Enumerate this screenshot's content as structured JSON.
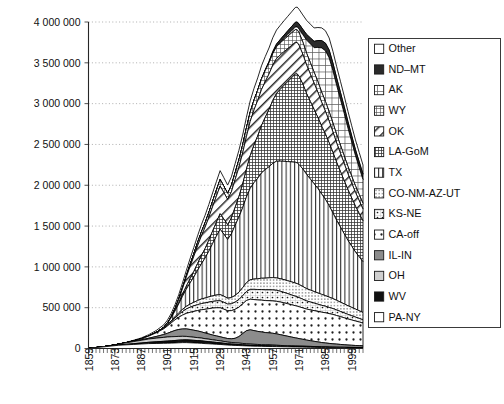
{
  "chart_data": {
    "type": "area",
    "stacked": true,
    "title": "",
    "subtitle": "",
    "xlabel": "",
    "ylabel": "",
    "grid": true,
    "legend_position": "right",
    "xlim": [
      1859,
      2005
    ],
    "ylim": [
      0,
      4000000
    ],
    "y_ticks": [
      0,
      500000,
      1000000,
      1500000,
      2000000,
      2500000,
      3000000,
      3500000,
      4000000
    ],
    "y_tick_labels": [
      "0",
      "500 000",
      "1 000 000",
      "1 500 000",
      "2 000 000",
      "2 500 000",
      "3 000 000",
      "3 500 000",
      "4 000 000"
    ],
    "x_ticks": [
      1859,
      1873,
      1887,
      1901,
      1915,
      1929,
      1943,
      1957,
      1971,
      1985,
      1999
    ],
    "x_tick_labels": [
      "1859",
      "1873",
      "1887",
      "1901",
      "1915",
      "1929",
      "1943",
      "1957",
      "1971",
      "1985",
      "1999"
    ],
    "x_minor_tick_interval": 2,
    "x": [
      1859,
      1863,
      1867,
      1871,
      1875,
      1879,
      1883,
      1887,
      1891,
      1895,
      1899,
      1901,
      1903,
      1905,
      1907,
      1909,
      1911,
      1913,
      1915,
      1917,
      1919,
      1921,
      1923,
      1925,
      1927,
      1929,
      1931,
      1933,
      1935,
      1937,
      1939,
      1941,
      1943,
      1945,
      1947,
      1949,
      1951,
      1953,
      1955,
      1957,
      1959,
      1961,
      1963,
      1965,
      1967,
      1969,
      1970,
      1971,
      1973,
      1975,
      1977,
      1979,
      1981,
      1983,
      1985,
      1987,
      1989,
      1991,
      1993,
      1995,
      1997,
      1999,
      2001,
      2003,
      2005
    ],
    "series": [
      {
        "name": "PA-NY",
        "pattern": "solid-white",
        "values": [
          2000,
          12000,
          20000,
          30000,
          40000,
          45000,
          50000,
          55000,
          60000,
          62000,
          64000,
          65000,
          66000,
          68000,
          70000,
          72000,
          72000,
          70000,
          68000,
          66000,
          64000,
          60000,
          58000,
          55000,
          52000,
          50000,
          46000,
          42000,
          40000,
          38000,
          36000,
          34000,
          32000,
          30000,
          29000,
          28000,
          27000,
          26000,
          25000,
          24000,
          23000,
          22000,
          21000,
          20000,
          19000,
          18000,
          18000,
          17500,
          17000,
          16000,
          15000,
          14000,
          13000,
          12000,
          11000,
          10000,
          9500,
          9000,
          8500,
          8000,
          7500,
          7000,
          6800,
          6500,
          6000
        ]
      },
      {
        "name": "WV",
        "pattern": "solid-black",
        "values": [
          0,
          0,
          0,
          1000,
          3000,
          6000,
          9000,
          12000,
          16000,
          20000,
          24000,
          26000,
          28000,
          30000,
          32000,
          33000,
          34000,
          33000,
          32000,
          31000,
          30000,
          28000,
          26000,
          24000,
          22000,
          20000,
          18000,
          16000,
          15000,
          14000,
          13000,
          12000,
          11000,
          10000,
          9500,
          9000,
          8500,
          8000,
          7500,
          7000,
          6500,
          6000,
          5500,
          5200,
          5000,
          4800,
          4700,
          4600,
          4400,
          4200,
          4000,
          3800,
          3600,
          3400,
          3200,
          3000,
          2900,
          2800,
          2700,
          2600,
          2500,
          2400,
          2300,
          2200,
          2100
        ]
      },
      {
        "name": "OH",
        "pattern": "light-gray",
        "values": [
          0,
          0,
          2000,
          5000,
          10000,
          18000,
          26000,
          33000,
          40000,
          45000,
          48000,
          50000,
          50000,
          48000,
          46000,
          44000,
          42000,
          40000,
          38000,
          36000,
          34000,
          32000,
          30000,
          28000,
          26000,
          24000,
          22000,
          20000,
          19000,
          18000,
          17000,
          16000,
          15000,
          14000,
          13000,
          12500,
          12000,
          11500,
          11000,
          10500,
          10000,
          9500,
          9000,
          8500,
          8000,
          7500,
          7400,
          7200,
          7000,
          6800,
          6500,
          6200,
          6000,
          5800,
          5500,
          5200,
          5000,
          4800,
          4600,
          4400,
          4200,
          4000,
          3800,
          3600,
          3400
        ]
      },
      {
        "name": "IL-IN",
        "pattern": "mid-gray",
        "values": [
          0,
          0,
          0,
          0,
          0,
          0,
          2000,
          5000,
          10000,
          20000,
          35000,
          45000,
          60000,
          75000,
          85000,
          90000,
          92000,
          90000,
          86000,
          82000,
          76000,
          70000,
          64000,
          58000,
          54000,
          50000,
          46000,
          44000,
          45000,
          55000,
          80000,
          120000,
          160000,
          175000,
          168000,
          160000,
          155000,
          150000,
          148000,
          145000,
          140000,
          132000,
          124000,
          116000,
          108000,
          100000,
          96000,
          92000,
          84000,
          76000,
          70000,
          64000,
          58000,
          52000,
          48000,
          44000,
          40000,
          37000,
          34000,
          31000,
          28000,
          26000,
          24000,
          22000,
          20000
        ]
      },
      {
        "name": "CA-off",
        "pattern": "dots-large",
        "values": [
          0,
          0,
          0,
          0,
          0,
          2000,
          6000,
          12000,
          25000,
          45000,
          70000,
          90000,
          110000,
          130000,
          150000,
          170000,
          190000,
          210000,
          230000,
          250000,
          270000,
          290000,
          310000,
          330000,
          345000,
          355000,
          350000,
          340000,
          345000,
          355000,
          360000,
          365000,
          370000,
          375000,
          380000,
          385000,
          390000,
          392000,
          394000,
          396000,
          398000,
          400000,
          400000,
          398000,
          396000,
          394000,
          392000,
          390000,
          385000,
          380000,
          378000,
          376000,
          374000,
          372000,
          370000,
          365000,
          360000,
          350000,
          340000,
          330000,
          320000,
          310000,
          300000,
          290000,
          280000
        ]
      },
      {
        "name": "KS-NE",
        "pattern": "dot-box",
        "values": [
          0,
          0,
          0,
          0,
          0,
          0,
          0,
          0,
          0,
          2000,
          6000,
          10000,
          16000,
          24000,
          34000,
          44000,
          54000,
          62000,
          68000,
          72000,
          76000,
          78000,
          80000,
          82000,
          84000,
          86000,
          84000,
          82000,
          84000,
          88000,
          94000,
          100000,
          110000,
          120000,
          125000,
          128000,
          130000,
          132000,
          134000,
          136000,
          135000,
          132000,
          128000,
          124000,
          120000,
          116000,
          114000,
          112000,
          106000,
          100000,
          96000,
          92000,
          88000,
          84000,
          80000,
          76000,
          72000,
          68000,
          64000,
          60000,
          56000,
          52000,
          48000,
          44000,
          40000
        ]
      },
      {
        "name": "CO-NM-AZ-UT",
        "pattern": "dots-fine",
        "values": [
          0,
          0,
          0,
          0,
          0,
          0,
          0,
          0,
          0,
          0,
          2000,
          4000,
          8000,
          14000,
          20000,
          26000,
          32000,
          38000,
          44000,
          50000,
          56000,
          60000,
          64000,
          68000,
          72000,
          76000,
          74000,
          72000,
          76000,
          82000,
          90000,
          98000,
          108000,
          118000,
          126000,
          132000,
          138000,
          142000,
          146000,
          150000,
          152000,
          154000,
          156000,
          158000,
          160000,
          162000,
          162000,
          160000,
          156000,
          150000,
          146000,
          142000,
          138000,
          134000,
          130000,
          126000,
          122000,
          118000,
          114000,
          110000,
          106000,
          102000,
          98000,
          94000,
          90000
        ]
      },
      {
        "name": "TX",
        "pattern": "vertical-lines",
        "values": [
          0,
          0,
          0,
          0,
          0,
          0,
          0,
          0,
          0,
          2000,
          10000,
          20000,
          40000,
          70000,
          110000,
          160000,
          210000,
          260000,
          310000,
          370000,
          430000,
          490000,
          560000,
          640000,
          720000,
          800000,
          760000,
          720000,
          780000,
          860000,
          920000,
          980000,
          1050000,
          1120000,
          1180000,
          1230000,
          1290000,
          1330000,
          1360000,
          1400000,
          1430000,
          1440000,
          1450000,
          1460000,
          1470000,
          1480000,
          1480000,
          1470000,
          1440000,
          1400000,
          1360000,
          1320000,
          1280000,
          1230000,
          1180000,
          1120000,
          1050000,
          980000,
          920000,
          860000,
          800000,
          750000,
          700000,
          660000,
          620000
        ]
      },
      {
        "name": "LA-GoM",
        "pattern": "cross-hatch-dense",
        "values": [
          0,
          0,
          0,
          0,
          0,
          0,
          0,
          0,
          0,
          0,
          0,
          0,
          2000,
          6000,
          14000,
          24000,
          36000,
          50000,
          66000,
          84000,
          100000,
          116000,
          134000,
          152000,
          170000,
          190000,
          185000,
          180000,
          195000,
          220000,
          250000,
          290000,
          340000,
          400000,
          460000,
          520000,
          580000,
          640000,
          700000,
          770000,
          830000,
          880000,
          930000,
          980000,
          1030000,
          1080000,
          1090000,
          1080000,
          1040000,
          990000,
          950000,
          910000,
          870000,
          830000,
          800000,
          770000,
          740000,
          710000,
          680000,
          650000,
          620000,
          590000,
          560000,
          530000,
          500000
        ]
      },
      {
        "name": "OK",
        "pattern": "diagonal-hatch",
        "values": [
          0,
          0,
          0,
          0,
          0,
          0,
          0,
          0,
          0,
          0,
          0,
          2000,
          8000,
          20000,
          40000,
          70000,
          110000,
          150000,
          185000,
          215000,
          240000,
          260000,
          280000,
          300000,
          320000,
          340000,
          325000,
          310000,
          320000,
          340000,
          360000,
          380000,
          400000,
          420000,
          430000,
          435000,
          440000,
          438000,
          436000,
          432000,
          428000,
          420000,
          412000,
          404000,
          396000,
          388000,
          384000,
          380000,
          365000,
          350000,
          336000,
          322000,
          308000,
          294000,
          280000,
          266000,
          252000,
          238000,
          224000,
          210000,
          196000,
          182000,
          170000,
          158000,
          146000
        ]
      },
      {
        "name": "WY",
        "pattern": "grid-fine",
        "values": [
          0,
          0,
          0,
          0,
          0,
          0,
          0,
          0,
          0,
          0,
          0,
          0,
          0,
          2000,
          5000,
          10000,
          16000,
          24000,
          32000,
          40000,
          48000,
          54000,
          60000,
          66000,
          72000,
          78000,
          76000,
          74000,
          78000,
          84000,
          90000,
          96000,
          104000,
          112000,
          118000,
          124000,
          130000,
          134000,
          138000,
          142000,
          145000,
          148000,
          150000,
          152000,
          154000,
          156000,
          156000,
          155000,
          150000,
          145000,
          140000,
          135000,
          130000,
          125000,
          120000,
          115000,
          110000,
          105000,
          100000,
          95000,
          90000,
          85000,
          80000,
          75000,
          70000
        ]
      },
      {
        "name": "AK",
        "pattern": "grid-coarse",
        "values": [
          0,
          0,
          0,
          0,
          0,
          0,
          0,
          0,
          0,
          0,
          0,
          0,
          0,
          0,
          0,
          0,
          0,
          0,
          0,
          0,
          0,
          0,
          0,
          0,
          0,
          0,
          0,
          0,
          0,
          0,
          0,
          0,
          0,
          0,
          0,
          0,
          0,
          0,
          0,
          2000,
          4000,
          8000,
          14000,
          20000,
          26000,
          32000,
          36000,
          45000,
          90000,
          160000,
          230000,
          300000,
          420000,
          540000,
          620000,
          660000,
          640000,
          600000,
          560000,
          520000,
          470000,
          420000,
          370000,
          330000,
          290000
        ]
      },
      {
        "name": "ND-MT",
        "pattern": "solid-dark",
        "values": [
          0,
          0,
          0,
          0,
          0,
          0,
          0,
          0,
          0,
          0,
          0,
          0,
          0,
          0,
          0,
          0,
          0,
          0,
          0,
          0,
          0,
          0,
          0,
          0,
          0,
          0,
          0,
          0,
          0,
          0,
          0,
          0,
          0,
          0,
          0,
          0,
          4000,
          10000,
          16000,
          22000,
          28000,
          34000,
          40000,
          46000,
          52000,
          58000,
          60000,
          62000,
          66000,
          70000,
          74000,
          78000,
          84000,
          90000,
          94000,
          96000,
          94000,
          90000,
          86000,
          82000,
          78000,
          74000,
          72000,
          70000,
          68000
        ]
      },
      {
        "name": "Other",
        "pattern": "solid-white",
        "values": [
          0,
          0,
          0,
          1000,
          2000,
          4000,
          8000,
          12000,
          18000,
          24000,
          30000,
          36000,
          42000,
          48000,
          54000,
          60000,
          66000,
          72000,
          78000,
          84000,
          90000,
          94000,
          98000,
          102000,
          106000,
          110000,
          106000,
          102000,
          106000,
          112000,
          118000,
          124000,
          132000,
          140000,
          146000,
          152000,
          158000,
          162000,
          166000,
          170000,
          172000,
          174000,
          176000,
          178000,
          180000,
          182000,
          182000,
          180000,
          176000,
          172000,
          168000,
          164000,
          160000,
          156000,
          152000,
          148000,
          144000,
          140000,
          136000,
          132000,
          128000,
          124000,
          120000,
          116000,
          112000
        ]
      }
    ],
    "annotations": {
      "peak_year": 1970,
      "peak_value": 3520000,
      "secondary_peak_year": 1985,
      "secondary_peak_value": 3270000
    }
  },
  "legend": {
    "items": [
      {
        "label": "Other",
        "pattern": "solid-white"
      },
      {
        "label": "ND–MT",
        "pattern": "solid-dark"
      },
      {
        "label": "AK",
        "pattern": "grid-coarse"
      },
      {
        "label": "WY",
        "pattern": "grid-fine"
      },
      {
        "label": "OK",
        "pattern": "diagonal-hatch"
      },
      {
        "label": "LA-GoM",
        "pattern": "cross-hatch-dense"
      },
      {
        "label": "TX",
        "pattern": "vertical-lines"
      },
      {
        "label": "CO-NM-AZ-UT",
        "pattern": "dots-fine"
      },
      {
        "label": "KS-NE",
        "pattern": "dot-box"
      },
      {
        "label": "CA-off",
        "pattern": "dots-large"
      },
      {
        "label": "IL-IN",
        "pattern": "mid-gray"
      },
      {
        "label": "OH",
        "pattern": "light-gray"
      },
      {
        "label": "WV",
        "pattern": "solid-black"
      },
      {
        "label": "PA-NY",
        "pattern": "solid-white"
      }
    ]
  },
  "colors": {
    "axis": "#262626",
    "grid": "#9a9a9a",
    "outline": "#000000",
    "background": "#ffffff",
    "solid_black": "#111111",
    "solid_dark": "#2b2b2b",
    "mid_gray": "#8c8c8c",
    "light_gray": "#cfcfcf"
  }
}
